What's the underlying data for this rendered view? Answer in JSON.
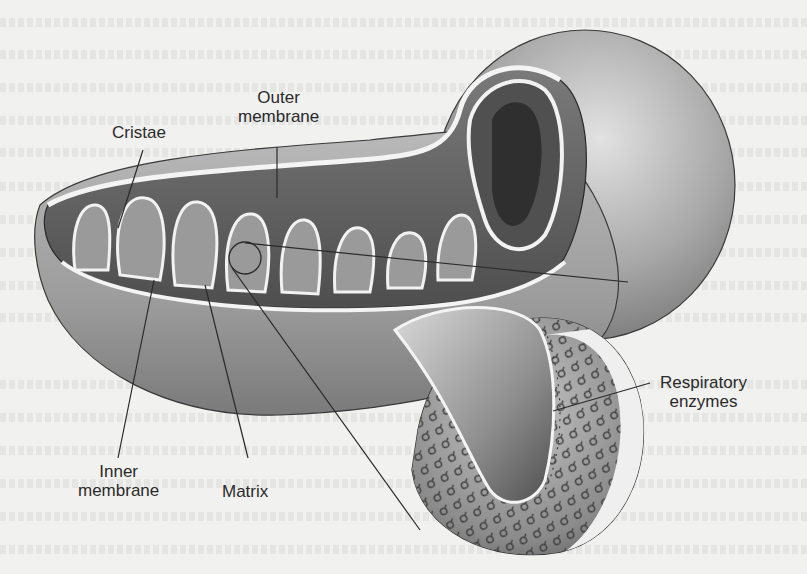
{
  "figure": {
    "labels": {
      "cristae": "Cristae",
      "outer_membrane_line1": "Outer",
      "outer_membrane_line2": "membrane",
      "inner_membrane_line1": "Inner",
      "inner_membrane_line2": "membrane",
      "matrix": "Matrix",
      "respiratory_enzymes_line1": "Respiratory",
      "respiratory_enzymes_line2": "enzymes"
    }
  },
  "colors": {
    "background": "#f1f1ef",
    "outer_shell": "#a9a9a9",
    "outer_shell_highlight": "#d8d8d8",
    "inner_dark": "#5a5a5a",
    "membrane_line": "#f4f4f4",
    "outline": "#2a2a2a",
    "label_text": "#2a2a2a"
  }
}
